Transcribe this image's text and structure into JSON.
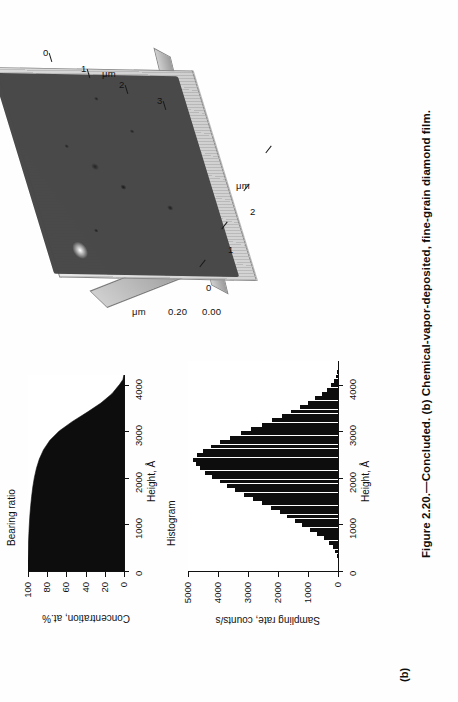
{
  "figure": {
    "panel_label": "(b)",
    "caption": "Figure 2.20.—Concluded. (b) Chemical-vapor-deposited, fine-grain diamond film."
  },
  "afm": {
    "title": "",
    "x_axis_unit": "μm",
    "y_axis_unit": "μm",
    "z_axis_unit": "μm",
    "x_ticks": [
      "0",
      "1",
      "2",
      "3"
    ],
    "y_ticks": [
      "0",
      "1",
      "2",
      "3"
    ],
    "z_ticks": [
      "0.00",
      "0.20"
    ]
  },
  "charts": [
    {
      "id": "histogram",
      "title": "Histogram",
      "type": "bar",
      "xlabel": "Height, Å",
      "ylabel": "Sampling rate, counts/s",
      "x_ticks": [
        "0",
        "1000",
        "2000",
        "3000",
        "4000"
      ],
      "y_ticks": [
        "0",
        "1000",
        "2000",
        "3000",
        "4000",
        "5000"
      ],
      "xlim": [
        0,
        4500
      ],
      "ylim": [
        0,
        5000
      ],
      "values": [
        0,
        0,
        10,
        40,
        90,
        170,
        300,
        470,
        700,
        950,
        1200,
        1450,
        1700,
        1950,
        2250,
        2550,
        2850,
        3150,
        3450,
        3700,
        3950,
        4200,
        4420,
        4600,
        4750,
        4830,
        4700,
        4500,
        4250,
        3950,
        3600,
        3250,
        2900,
        2550,
        2200,
        1880,
        1560,
        1270,
        1000,
        760,
        540,
        360,
        220,
        120,
        55,
        20,
        5,
        0
      ]
    },
    {
      "id": "bearing-ratio",
      "title": "Bearing ratio",
      "type": "area",
      "xlabel": "Height, Å",
      "ylabel": "Concentration, at.%",
      "x_ticks": [
        "0",
        "1000",
        "2000",
        "3000",
        "4000"
      ],
      "y_ticks": [
        "0",
        "20",
        "40",
        "60",
        "80",
        "100"
      ],
      "xlim": [
        0,
        4200
      ],
      "ylim": [
        0,
        100
      ],
      "x": [
        0,
        200,
        400,
        600,
        800,
        1000,
        1200,
        1400,
        1600,
        1800,
        2000,
        2200,
        2400,
        2600,
        2800,
        3000,
        3200,
        3400,
        3600,
        3800,
        4000,
        4100,
        4200
      ],
      "values": [
        100,
        100,
        99.8,
        99.5,
        99.1,
        98.6,
        98.0,
        97.2,
        96.2,
        95.0,
        93.4,
        91.2,
        88.2,
        83.8,
        77.2,
        67.5,
        54.0,
        38.5,
        24.0,
        12.5,
        4.5,
        1.2,
        0
      ]
    }
  ],
  "chart_data": [
    {
      "type": "bar",
      "title": "Histogram",
      "xlabel": "Height, Å",
      "ylabel": "Sampling rate, counts/s",
      "xlim": [
        0,
        4500
      ],
      "ylim": [
        0,
        5000
      ],
      "x_tick_labels": [
        "0",
        "1000",
        "2000",
        "3000",
        "4000"
      ],
      "y_tick_labels": [
        "0",
        "1000",
        "2000",
        "3000",
        "4000",
        "5000"
      ],
      "grid": false,
      "legend": "none",
      "categories": [
        750,
        830,
        910,
        990,
        1070,
        1150,
        1230,
        1310,
        1390,
        1470,
        1550,
        1630,
        1710,
        1790,
        1870,
        1950,
        2030,
        2110,
        2190,
        2270,
        2350,
        2430,
        2510,
        2590,
        2670,
        2750,
        2830,
        2910,
        2990,
        3070,
        3150,
        3230,
        3310,
        3390,
        3470,
        3550,
        3630,
        3710,
        3790,
        3870,
        3950,
        4030,
        4110,
        4190,
        4270,
        4350,
        4430,
        4510
      ],
      "values": [
        0,
        0,
        10,
        40,
        90,
        170,
        300,
        470,
        700,
        950,
        1200,
        1450,
        1700,
        1950,
        2250,
        2550,
        2850,
        3150,
        3450,
        3700,
        3950,
        4200,
        4420,
        4600,
        4750,
        4830,
        4700,
        4500,
        4250,
        3950,
        3600,
        3250,
        2900,
        2550,
        2200,
        1880,
        1560,
        1270,
        1000,
        760,
        540,
        360,
        220,
        120,
        55,
        20,
        5,
        0
      ]
    },
    {
      "type": "area",
      "title": "Bearing ratio",
      "xlabel": "Height, Å",
      "ylabel": "Concentration, at.%",
      "xlim": [
        0,
        4200
      ],
      "ylim": [
        0,
        100
      ],
      "x_tick_labels": [
        "0",
        "1000",
        "2000",
        "3000",
        "4000"
      ],
      "y_tick_labels": [
        "0",
        "20",
        "40",
        "60",
        "80",
        "100"
      ],
      "grid": false,
      "legend": "none",
      "x": [
        0,
        200,
        400,
        600,
        800,
        1000,
        1200,
        1400,
        1600,
        1800,
        2000,
        2200,
        2400,
        2600,
        2800,
        3000,
        3200,
        3400,
        3600,
        3800,
        4000,
        4100,
        4200
      ],
      "values": [
        100,
        100,
        99.8,
        99.5,
        99.1,
        98.6,
        98.0,
        97.2,
        96.2,
        95.0,
        93.4,
        91.2,
        88.2,
        83.8,
        77.2,
        67.5,
        54.0,
        38.5,
        24.0,
        12.5,
        4.5,
        1.2,
        0
      ]
    }
  ],
  "colors": {
    "ink": "#0d0d0d",
    "paper": "#fefefe",
    "fill": "#0d0d0d"
  }
}
